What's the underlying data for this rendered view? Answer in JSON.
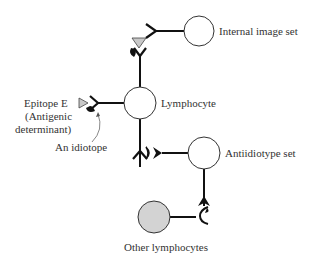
{
  "diagram": {
    "nodes": {
      "internal_image": {
        "label": "Internal image set",
        "fill": "#ffffff"
      },
      "lymphocyte": {
        "label": "Lymphocyte",
        "fill": "#ffffff"
      },
      "antiidiotype": {
        "label": "Antiidiotype set",
        "fill": "#ffffff"
      },
      "other": {
        "label": "Other lymphocytes",
        "fill": "#d3d3d3"
      }
    },
    "annotations": {
      "epitope_line1": "Epitope E",
      "epitope_line2": "(Antigenic",
      "epitope_line3": "determinant)",
      "idiotope": "An idiotope"
    },
    "colors": {
      "stroke": "#111111",
      "epitope_fill": "#c8c8c8",
      "other_fill": "#d3d3d3",
      "text": "#333333"
    }
  }
}
